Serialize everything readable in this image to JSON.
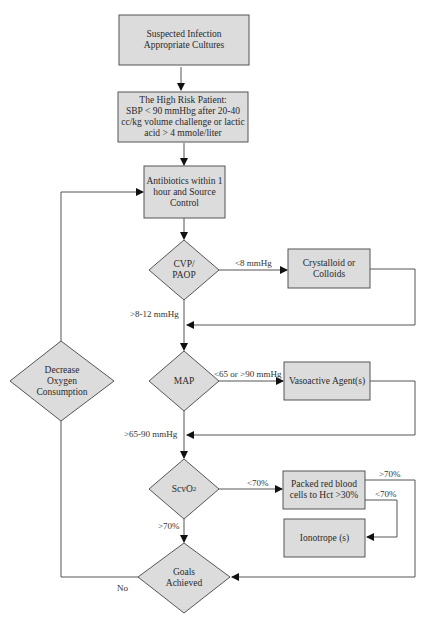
{
  "diagram": {
    "type": "flowchart",
    "colors": {
      "node_fill": "#dcdcdc",
      "node_stroke": "#555555",
      "line": "#555555",
      "arrow": "#111111",
      "background": "#ffffff"
    },
    "nodes": [
      {
        "id": "suspected_infection",
        "shape": "rect",
        "lines": [
          "Suspected Infection",
          "Appropriate Cultures"
        ]
      },
      {
        "id": "high_risk_patient",
        "shape": "rect",
        "lines": [
          "The High Risk Patient:",
          "SBP < 90 mmHbg after 20-40",
          "cc/kg volume challenge or lactic",
          "acid > 4 mmole/liter"
        ]
      },
      {
        "id": "antibiotics",
        "shape": "rect",
        "lines": [
          "Antibiotics within 1",
          "hour and Source",
          "Control"
        ]
      },
      {
        "id": "cvp_paop",
        "shape": "diamond",
        "lines": [
          "CVP/",
          "PAOP"
        ]
      },
      {
        "id": "crystalloid",
        "shape": "rect",
        "lines": [
          "Crystalloid or",
          "Colloids"
        ]
      },
      {
        "id": "map",
        "shape": "diamond",
        "lines": [
          "MAP"
        ]
      },
      {
        "id": "vasoactive",
        "shape": "rect",
        "lines": [
          "Vasoactive Agent(s)"
        ]
      },
      {
        "id": "scvo2",
        "shape": "diamond",
        "label_main": "ScvO",
        "label_sub": "2"
      },
      {
        "id": "packed_rbc",
        "shape": "rect",
        "lines": [
          "Packed red blood",
          "cells to Hct >30%"
        ]
      },
      {
        "id": "ionotrope",
        "shape": "rect",
        "lines": [
          "Ionotrope (s)"
        ]
      },
      {
        "id": "goals_achieved",
        "shape": "diamond",
        "lines": [
          "Goals",
          "Achieved"
        ]
      },
      {
        "id": "decrease_oxygen",
        "shape": "diamond",
        "lines": [
          "Decrease",
          "Oxygen",
          "Consumption"
        ]
      }
    ],
    "edges": [
      {
        "from": "suspected_infection",
        "to": "high_risk_patient",
        "label": ""
      },
      {
        "from": "high_risk_patient",
        "to": "antibiotics",
        "label": ""
      },
      {
        "from": "antibiotics",
        "to": "cvp_paop",
        "label": ""
      },
      {
        "from": "cvp_paop",
        "to": "crystalloid",
        "label": "<8 mmHg"
      },
      {
        "from": "crystalloid",
        "to": "map",
        "label": ""
      },
      {
        "from": "cvp_paop",
        "to": "map",
        "label": ">8-12 mmHg"
      },
      {
        "from": "map",
        "to": "vasoactive",
        "label": "<65 or >90 mmHg"
      },
      {
        "from": "vasoactive",
        "to": "scvo2",
        "label": ""
      },
      {
        "from": "map",
        "to": "scvo2",
        "label": ">65-90 mmHg"
      },
      {
        "from": "scvo2",
        "to": "packed_rbc",
        "label": "<70%"
      },
      {
        "from": "packed_rbc",
        "to": "goals_achieved",
        "label": ">70%"
      },
      {
        "from": "packed_rbc",
        "to": "ionotrope",
        "label": "<70%"
      },
      {
        "from": "scvo2",
        "to": "goals_achieved",
        "label": ">70%"
      },
      {
        "from": "goals_achieved",
        "to": "decrease_oxygen",
        "label": "No"
      },
      {
        "from": "decrease_oxygen",
        "to": "antibiotics",
        "label": ""
      }
    ]
  }
}
